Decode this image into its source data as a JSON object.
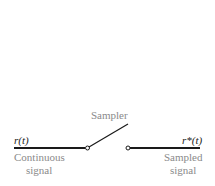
{
  "diagram": {
    "sampler_label": "Sampler",
    "input": {
      "symbol": "r(t)",
      "caption_line1": "Continuous",
      "caption_line2": "signal"
    },
    "output": {
      "symbol": "r*(t)",
      "caption_line1": "Sampled",
      "caption_line2": "signal"
    },
    "colors": {
      "line": "#1a1a1a",
      "text": "#8a8a8a",
      "symbol": "#222222"
    }
  }
}
